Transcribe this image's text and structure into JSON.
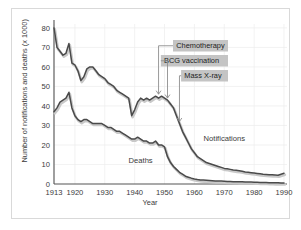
{
  "chart_data": {
    "type": "line",
    "title": "",
    "xlabel": "Year",
    "ylabel": "Number of notifications and deaths (x 1000)",
    "xlim": [
      1913,
      1991
    ],
    "ylim": [
      0,
      82
    ],
    "xticks": [
      "1913",
      "1920",
      "1930",
      "1940",
      "1950",
      "1960",
      "1970",
      "1980",
      "1990"
    ],
    "xtick_values": [
      1913,
      1920,
      1930,
      1940,
      1950,
      1960,
      1970,
      1980,
      1990
    ],
    "yticks": [
      "0",
      "10",
      "20",
      "30",
      "40",
      "50",
      "60",
      "70",
      "80"
    ],
    "ytick_values": [
      0,
      10,
      20,
      30,
      40,
      50,
      60,
      70,
      80
    ],
    "grid": true,
    "legend_position": "inline-labels",
    "series": [
      {
        "name": "Notifications",
        "label_x": 1970,
        "label_y": 22,
        "color": "#4a4a4a",
        "x": [
          1913,
          1914,
          1915,
          1916,
          1917,
          1918,
          1919,
          1920,
          1921,
          1922,
          1923,
          1924,
          1925,
          1926,
          1927,
          1928,
          1929,
          1930,
          1931,
          1932,
          1933,
          1934,
          1935,
          1936,
          1937,
          1938,
          1939,
          1940,
          1941,
          1942,
          1943,
          1944,
          1945,
          1946,
          1947,
          1948,
          1949,
          1950,
          1951,
          1952,
          1953,
          1954,
          1955,
          1956,
          1957,
          1958,
          1959,
          1960,
          1961,
          1962,
          1963,
          1964,
          1965,
          1966,
          1967,
          1968,
          1969,
          1970,
          1971,
          1972,
          1973,
          1974,
          1975,
          1976,
          1977,
          1978,
          1979,
          1980,
          1981,
          1982,
          1983,
          1984,
          1985,
          1986,
          1987,
          1988,
          1989,
          1990
        ],
        "values": [
          80,
          70,
          68,
          66,
          67,
          72,
          62,
          61,
          58,
          53,
          55,
          59,
          60,
          60,
          58,
          56,
          55,
          54,
          52,
          51,
          50,
          48,
          47,
          46,
          45,
          44,
          35,
          38,
          42,
          44,
          43,
          44,
          43,
          44,
          45,
          44,
          45,
          44,
          43,
          41,
          39,
          35,
          31,
          27,
          24,
          21,
          18,
          16,
          14,
          13,
          12,
          11,
          10.5,
          10,
          9.5,
          9,
          8.5,
          8,
          7.8,
          7.5,
          7.2,
          7,
          6.8,
          6.5,
          6.2,
          6,
          5.8,
          5.6,
          5.4,
          5.2,
          5,
          4.9,
          4.8,
          4.7,
          4.6,
          4.5,
          5,
          5.5
        ]
      },
      {
        "name": "Deaths",
        "label_x": 1942,
        "label_y": 11,
        "color": "#4a4a4a",
        "x": [
          1913,
          1914,
          1915,
          1916,
          1917,
          1918,
          1919,
          1920,
          1921,
          1922,
          1923,
          1924,
          1925,
          1926,
          1927,
          1928,
          1929,
          1930,
          1931,
          1932,
          1933,
          1934,
          1935,
          1936,
          1937,
          1938,
          1939,
          1940,
          1941,
          1942,
          1943,
          1944,
          1945,
          1946,
          1947,
          1948,
          1949,
          1950,
          1951,
          1952,
          1953,
          1954,
          1955,
          1956,
          1957,
          1958,
          1959,
          1960,
          1961,
          1962,
          1963,
          1964,
          1965,
          1966,
          1967,
          1968,
          1969,
          1970,
          1971,
          1972,
          1973,
          1974,
          1975,
          1976,
          1977,
          1978,
          1979,
          1980,
          1981,
          1982,
          1983,
          1984,
          1985,
          1986,
          1987,
          1988,
          1989,
          1990
        ],
        "values": [
          37,
          39,
          42,
          43,
          44,
          47,
          39,
          35,
          33,
          32,
          33,
          33,
          32,
          31,
          31,
          31,
          31,
          30,
          29,
          29,
          28,
          27,
          27,
          26,
          25,
          24,
          23,
          23,
          24,
          23,
          22,
          22,
          21,
          21,
          22,
          20,
          20,
          19,
          14,
          11,
          9,
          7.5,
          6,
          5,
          4,
          3.5,
          3,
          2.6,
          2.3,
          2.1,
          2,
          1.9,
          1.8,
          1.7,
          1.6,
          1.5,
          1.5,
          1.4,
          1.3,
          1.3,
          1.2,
          1.2,
          1.1,
          1.1,
          1,
          1,
          1,
          0.9,
          0.9,
          0.8,
          0.8,
          0.8,
          0.7,
          0.7,
          0.6,
          0.6,
          0.5,
          0.5
        ]
      }
    ],
    "annotations": [
      {
        "text": "Chemotherapy",
        "arrow_year": 1948,
        "arrow_to_value": 45
      },
      {
        "text": "BCG vaccination",
        "arrow_year": 1951,
        "arrow_to_value": 43
      },
      {
        "text": "Mass X-ray",
        "arrow_year": 1955,
        "arrow_to_value": 31
      }
    ]
  },
  "colors": {
    "line": "#4a4a4a",
    "shadow": "#c9c9c9",
    "axis": "#555555",
    "grid": "#ececec",
    "annotation_bg": "#c4c4c4",
    "annotation_text": "#1c1c1c",
    "frame": "#d9d9d9",
    "background": "#ffffff"
  }
}
